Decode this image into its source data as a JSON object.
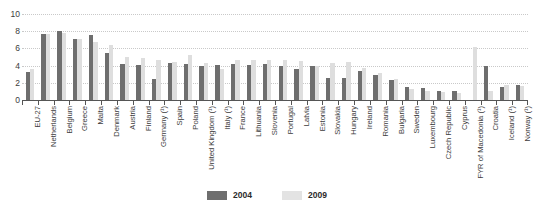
{
  "chart_data": {
    "type": "bar",
    "title": "",
    "xlabel": "",
    "ylabel": "",
    "ylim": [
      0,
      10
    ],
    "yticks": [
      0,
      2,
      4,
      6,
      8,
      10
    ],
    "grid": true,
    "legend_position": "bottom-center",
    "categories": [
      "EU-27",
      "Netherlands",
      "Belgium",
      "Greece",
      "Malta",
      "Denmark",
      "Austria",
      "Finland",
      "Germany (¹)",
      "Spain",
      "Poland",
      "United Kingdom (¹)",
      "Italy (¹)",
      "France",
      "Lithuania",
      "Slovenia",
      "Portugal",
      "Latvia",
      "Estonia",
      "Slovakia",
      "Hungary",
      "Ireland",
      "Romania",
      "Bulgaria",
      "Sweden",
      "Luxembourg",
      "Czech Republic",
      "Cyprus",
      "FYR of Macedonia (¹)",
      "Croatia",
      "Iceland (¹)",
      "Norway (¹)"
    ],
    "series": [
      {
        "name": "2004",
        "color": "#6e6e6e",
        "values": [
          3.3,
          7.7,
          8.0,
          7.1,
          7.6,
          5.5,
          4.2,
          4.1,
          2.4,
          4.3,
          4.2,
          4.0,
          4.1,
          4.2,
          4.1,
          4.2,
          4.0,
          3.6,
          4.0,
          2.6,
          2.6,
          3.4,
          2.9,
          2.3,
          1.5,
          1.4,
          1.1,
          1.0,
          0.0,
          4.0,
          1.5,
          1.7
        ]
      },
      {
        "name": "2009",
        "color": "#dedede",
        "values": [
          3.6,
          7.7,
          7.8,
          7.1,
          6.8,
          6.4,
          5.0,
          4.9,
          4.7,
          4.4,
          5.2,
          4.3,
          3.6,
          4.6,
          4.6,
          4.6,
          4.6,
          4.5,
          4.0,
          4.3,
          4.4,
          3.7,
          3.1,
          2.4,
          1.3,
          1.1,
          0.9,
          0.8,
          6.2,
          1.1,
          1.7,
          1.6
        ]
      }
    ]
  },
  "legend": {
    "items": [
      {
        "label": "2004",
        "color": "#6e6e6e"
      },
      {
        "label": "2009",
        "color": "#e3e3e3"
      }
    ]
  }
}
